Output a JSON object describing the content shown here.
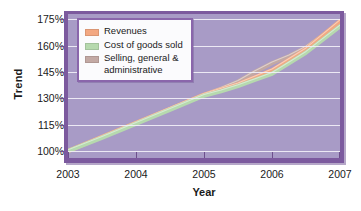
{
  "chart_data": {
    "type": "line",
    "title": "",
    "xlabel": "Year",
    "ylabel": "Trend",
    "x": [
      2003,
      2004,
      2005,
      2006,
      2007
    ],
    "xtick_labels": [
      "2003",
      "2004",
      "2005",
      "2006",
      "2007"
    ],
    "ytick_labels": [
      "175%",
      "160%",
      "145%",
      "130%",
      "115%",
      "100%"
    ],
    "ytick_values": [
      175,
      160,
      145,
      130,
      115,
      100
    ],
    "ylim": [
      96,
      178
    ],
    "xlim": [
      2003,
      2007
    ],
    "grid": true,
    "legend_position": "top-left",
    "series": [
      {
        "name": "Revenues",
        "color": "#f3a882",
        "values": [
          100,
          116,
          132,
          146,
          174
        ]
      },
      {
        "name": "Cost of goods sold",
        "color": "#b6d9ae",
        "values": [
          100,
          115.5,
          131.5,
          144,
          171
        ]
      },
      {
        "name": "Selling, general & administrative",
        "color": "#c3a9a4",
        "values": [
          100,
          116,
          132,
          150,
          173
        ]
      }
    ],
    "series_dense": {
      "x": [
        2003,
        2003.5,
        2004,
        2004.5,
        2005,
        2005.25,
        2005.5,
        2005.75,
        2006,
        2006.25,
        2006.5,
        2007
      ],
      "revenues": [
        100,
        108,
        116,
        124,
        132,
        135,
        138,
        142,
        146,
        152,
        158,
        174
      ],
      "cogs": [
        100,
        107.5,
        115.5,
        123.5,
        131.5,
        134,
        137,
        140.5,
        144,
        150,
        156,
        171
      ],
      "sga": [
        100,
        108,
        116,
        124,
        132,
        135.5,
        139.5,
        145,
        150,
        154,
        159,
        173
      ]
    },
    "plot_background": "#a89bc6",
    "gridline_color": "#f2f0f7",
    "frame_color": "#7c5a9e"
  },
  "legend": {
    "items": [
      {
        "label": "Revenues",
        "color": "#f3a882"
      },
      {
        "label": "Cost of goods sold",
        "color": "#b6d9ae"
      },
      {
        "label": "Selling, general &\nadministrative",
        "color": "#c3a9a4"
      }
    ]
  }
}
